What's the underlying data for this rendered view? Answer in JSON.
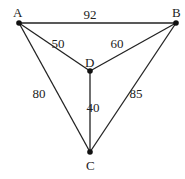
{
  "graph": {
    "nodes": [
      {
        "id": "A",
        "label": "A",
        "x": 19,
        "y": 23,
        "lx": 13,
        "ly": 17
      },
      {
        "id": "B",
        "label": "B",
        "x": 176,
        "y": 23,
        "lx": 172,
        "ly": 17
      },
      {
        "id": "D",
        "label": "D",
        "x": 90,
        "y": 71,
        "lx": 85,
        "ly": 67
      },
      {
        "id": "C",
        "label": "C",
        "x": 90,
        "y": 152,
        "lx": 86,
        "ly": 170
      }
    ],
    "edges": [
      {
        "from": "A",
        "to": "B",
        "weight": "92",
        "lx": 90,
        "ly": 19
      },
      {
        "from": "A",
        "to": "D",
        "weight": "50",
        "lx": 58,
        "ly": 48
      },
      {
        "from": "B",
        "to": "D",
        "weight": "60",
        "lx": 117,
        "ly": 48
      },
      {
        "from": "A",
        "to": "C",
        "weight": "80",
        "lx": 39,
        "ly": 98
      },
      {
        "from": "D",
        "to": "C",
        "weight": "40",
        "lx": 93,
        "ly": 112
      },
      {
        "from": "B",
        "to": "C",
        "weight": "85",
        "lx": 136,
        "ly": 98
      }
    ]
  }
}
